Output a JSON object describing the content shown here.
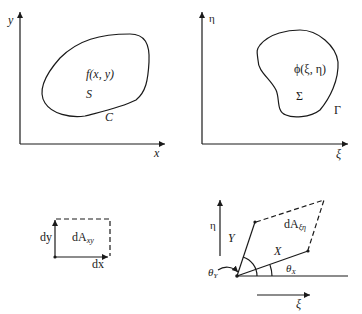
{
  "panels": {
    "top_left": {
      "axis_x": "x",
      "axis_y": "y",
      "function_label": "f(x, y)",
      "region_label": "S",
      "boundary_label": "C"
    },
    "top_right": {
      "axis_x": "ξ",
      "axis_y": "η",
      "function_label": "ϕ(ξ, η)",
      "region_label": "Σ",
      "boundary_label": "Γ"
    },
    "bottom_left": {
      "dy_label": "dy",
      "dx_label": "dx",
      "area_label_main": "dA",
      "area_label_sub": "xy"
    },
    "bottom_right": {
      "axis_y": "η",
      "axis_x": "ξ",
      "vec_y_label": "Y",
      "vec_x_label": "X",
      "theta_y_main": "θ",
      "theta_y_sub": "Y",
      "theta_x_main": "θ",
      "theta_x_sub": "X",
      "area_label_main": "dA",
      "area_label_sub": "ξη"
    }
  },
  "colors": {
    "ink": "#1a1a1a",
    "background": "#ffffff"
  }
}
